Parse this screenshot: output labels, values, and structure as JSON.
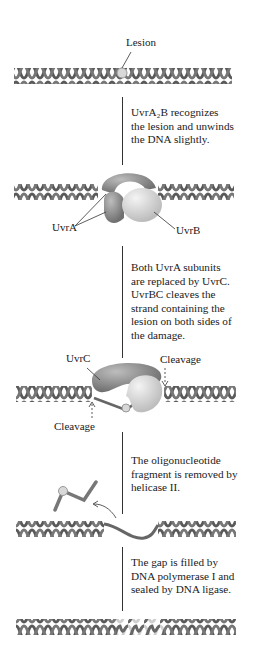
{
  "diagram": {
    "title_hint": "Nucleotide excision repair by UvrABC",
    "colors": {
      "dna_strand": "#5a5a5a",
      "dna_highlight": "#8a8a8a",
      "new_dna": "#cfcfcf",
      "lesion": "#d8d8d8",
      "uvrA": "#8d8d8d",
      "uvrB": "#dcdcdc",
      "uvrC": "#a0a0a0",
      "text": "#1a1a1a"
    },
    "stages": [
      {
        "id": "damaged-dna",
        "labels": {
          "lesion": "Lesion"
        }
      },
      {
        "id": "uvra2b-bound",
        "labels": {
          "uvra": "UvrA",
          "uvrb": "UvrB"
        }
      },
      {
        "id": "uvrbc-cleavage",
        "labels": {
          "uvrc": "UvrC",
          "cleavage_top": "Cleavage",
          "cleavage_bottom": "Cleavage"
        }
      },
      {
        "id": "fragment-removed",
        "labels": {}
      },
      {
        "id": "repaired-dna",
        "labels": {}
      }
    ],
    "steps": [
      {
        "text": "UvrA₂B recognizes\nthe lesion and unwinds\nthe DNA slightly."
      },
      {
        "text": "Both UvrA subunits\nare replaced by UvrC.\nUvrBC cleaves the\nstrand containing the\nlesion on both sides of\nthe damage."
      },
      {
        "text": "The oligonucleotide\nfragment is removed by\nhelicase II."
      },
      {
        "text": "The gap is filled by\nDNA polymerase I and\nsealed by DNA ligase."
      }
    ]
  }
}
